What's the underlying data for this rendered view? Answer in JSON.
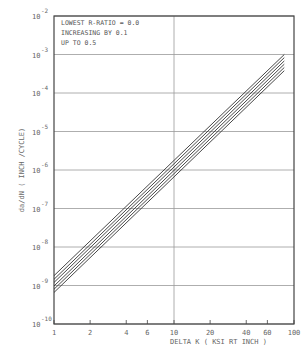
{
  "chart_data": {
    "type": "line",
    "title": "",
    "xlabel": "DELTA K ( KSI RT INCH )",
    "ylabel": "da/dN ( INCH /CYCLE)",
    "xscale": "log",
    "yscale": "log",
    "xlim": [
      1,
      100
    ],
    "ylim": [
      1e-10,
      0.01
    ],
    "x_ticks": [
      1,
      2,
      4,
      6,
      10,
      20,
      40,
      60,
      100
    ],
    "x_tick_labels": [
      "1",
      "2",
      "4",
      "6",
      "10",
      "20",
      "40",
      "60",
      "100"
    ],
    "y_ticks": [
      1e-10,
      1e-09,
      1e-08,
      1e-07,
      1e-06,
      1e-05,
      0.0001,
      0.001,
      0.01
    ],
    "y_tick_exponents": [
      "-10",
      "-9",
      "-8",
      "-7",
      "-6",
      "-5",
      "-4",
      "-3",
      "-2"
    ],
    "grid": {
      "horizontal": "every decade",
      "vertical": "at x=10 only"
    },
    "annotations": [
      "LOWEST R-RATIO = 0.0",
      "INCREASING BY 0.1",
      "UP TO 0.5"
    ],
    "legend_position": "upper-left inside plot",
    "x": [
      1,
      83
    ],
    "series": [
      {
        "name": "R = 0.0",
        "values": [
          6.6e-10,
          0.00038
        ]
      },
      {
        "name": "R = 0.1",
        "values": [
          8e-10,
          0.00046
        ]
      },
      {
        "name": "R = 0.2",
        "values": [
          9.7e-10,
          0.00056
        ]
      },
      {
        "name": "R = 0.3",
        "values": [
          1.2e-09,
          0.00068
        ]
      },
      {
        "name": "R = 0.4",
        "values": [
          1.45e-09,
          0.00083
        ]
      },
      {
        "name": "R = 0.5",
        "values": [
          1.8e-09,
          0.001
        ]
      }
    ]
  },
  "labels": {
    "annotation_line1": "LOWEST R-RATIO = 0.0",
    "annotation_line2": "INCREASING BY 0.1",
    "annotation_line3": "UP TO 0.5",
    "xlabel": "DELTA K ( KSI RT INCH )",
    "ylabel": "da/dN ( INCH /CYCLE)",
    "y_base": "10"
  }
}
